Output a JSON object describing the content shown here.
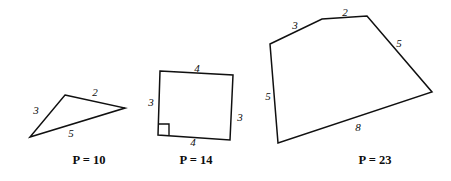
{
  "page": {
    "background_color": "#ffffff",
    "ink_color": "#101010",
    "width": 451,
    "height": 181
  },
  "figures": [
    {
      "id": "figure-1",
      "shape": "triangle",
      "vertices": [
        [
          65,
          95
        ],
        [
          125,
          108
        ],
        [
          30,
          137
        ]
      ],
      "points_attr": "65,95 125,108 30,137",
      "has_right_angle": false,
      "side_labels": [
        {
          "text": "3",
          "x": 36,
          "y": 110
        },
        {
          "text": "2",
          "x": 95,
          "y": 92
        },
        {
          "text": "5",
          "x": 71,
          "y": 133
        }
      ],
      "perimeter_caption": {
        "text": "P = 10",
        "x": 89,
        "y": 160
      }
    },
    {
      "id": "figure-2",
      "shape": "quadrilateral",
      "vertices": [
        [
          160,
          71
        ],
        [
          233,
          75
        ],
        [
          230,
          140
        ],
        [
          158,
          135
        ]
      ],
      "points_attr": "160,71 233,75 230,140 158,135",
      "has_right_angle": true,
      "right_angle_mark": "M158,124 L169,124 L169,135",
      "side_labels": [
        {
          "text": "4",
          "x": 197,
          "y": 68
        },
        {
          "text": "3",
          "x": 151,
          "y": 102
        },
        {
          "text": "3",
          "x": 240,
          "y": 117
        },
        {
          "text": "4",
          "x": 193,
          "y": 142
        }
      ],
      "perimeter_caption": {
        "text": "P = 14",
        "x": 196,
        "y": 160
      }
    },
    {
      "id": "figure-3",
      "shape": "pentagon",
      "vertices": [
        [
          270,
          44
        ],
        [
          322,
          19
        ],
        [
          367,
          16
        ],
        [
          432,
          92
        ],
        [
          278,
          143
        ]
      ],
      "points_attr": "270,44 322,19 367,16 432,92 278,143",
      "has_right_angle": false,
      "side_labels": [
        {
          "text": "3",
          "x": 295,
          "y": 25
        },
        {
          "text": "2",
          "x": 345,
          "y": 12
        },
        {
          "text": "5",
          "x": 399,
          "y": 43
        },
        {
          "text": "8",
          "x": 358,
          "y": 127
        },
        {
          "text": "5",
          "x": 268,
          "y": 96
        }
      ],
      "perimeter_caption": {
        "text": "P = 23",
        "x": 375,
        "y": 160
      }
    }
  ]
}
